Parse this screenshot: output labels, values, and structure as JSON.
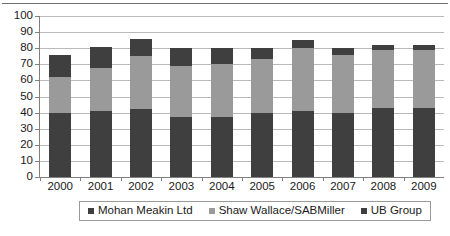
{
  "chart_data": {
    "type": "bar",
    "stacked": true,
    "title": "",
    "xlabel": "",
    "ylabel": "",
    "ylim": [
      0,
      100
    ],
    "ytick_step": 10,
    "yticks": [
      0,
      10,
      20,
      30,
      40,
      50,
      60,
      70,
      80,
      90,
      100
    ],
    "grid": true,
    "legend_position": "bottom",
    "categories": [
      "2000",
      "2001",
      "2002",
      "2003",
      "2004",
      "2005",
      "2006",
      "2007",
      "2008",
      "2009"
    ],
    "series": [
      {
        "name": "Mohan Meakin Ltd",
        "color": "#3f3f3f",
        "values": [
          40,
          41,
          42,
          37,
          37,
          40,
          41,
          40,
          43,
          43
        ]
      },
      {
        "name": "Shaw Wallace/SABMiller",
        "color": "#9a9a9a",
        "values": [
          22,
          27,
          33,
          32,
          33,
          33,
          39,
          36,
          36,
          36
        ]
      },
      {
        "name": "UB Group",
        "color": "#3f3f3f",
        "values": [
          14,
          13,
          11,
          11,
          10,
          7,
          5,
          4,
          3,
          3
        ]
      }
    ],
    "totals": [
      76,
      81,
      86,
      80,
      80,
      80,
      85,
      80,
      82,
      82
    ]
  },
  "legend": {
    "items": [
      {
        "label": "Mohan Meakin Ltd",
        "color": "#3f3f3f"
      },
      {
        "label": "Shaw Wallace/SABMiller",
        "color": "#9a9a9a"
      },
      {
        "label": "UB Group",
        "color": "#3f3f3f"
      }
    ]
  },
  "axes": {
    "y_tick_labels": [
      "100",
      "90",
      "80",
      "70",
      "60",
      "50",
      "40",
      "30",
      "20",
      "10",
      "0"
    ],
    "x_tick_labels": [
      "2000",
      "2001",
      "2002",
      "2003",
      "2004",
      "2005",
      "2006",
      "2007",
      "2008",
      "2009"
    ]
  },
  "colors": {
    "gridline": "#b9b9b9",
    "axis": "#808080",
    "text": "#1a1a1a",
    "background": "#ffffff"
  }
}
